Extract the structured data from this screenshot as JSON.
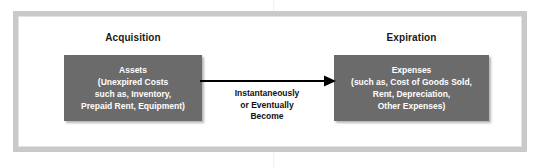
{
  "figure": {
    "type": "flow-diagram",
    "title_visible": false
  },
  "columns": [
    {
      "heading": "Acquisition"
    },
    {
      "heading": "Expiration"
    }
  ],
  "boxes": {
    "left": {
      "title": "Assets",
      "lines": [
        "(Unexpired Costs",
        "such as, Inventory,",
        "Prepaid Rent, Equipment)"
      ],
      "fill_color": "#6b6b6b",
      "text_color": "#ffffff"
    },
    "right": {
      "title": "Expenses",
      "lines": [
        "(such as, Cost of Goods Sold,",
        "Rent, Depreciation,",
        "Other Expenses)"
      ],
      "fill_color": "#6b6b6b",
      "text_color": "#ffffff"
    }
  },
  "arrow": {
    "direction": "left-to-right",
    "color": "#000000",
    "caption_lines": [
      "Instantaneously",
      "or Eventually",
      "Become"
    ]
  },
  "frame": {
    "border_color": "#c9c9c9",
    "background_color": "#ffffff"
  }
}
